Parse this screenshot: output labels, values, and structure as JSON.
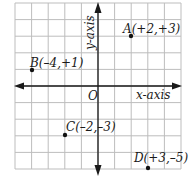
{
  "diagram": {
    "type": "coordinate-plane",
    "grid": {
      "x_min": -5,
      "x_max": 5,
      "y_min": -5,
      "y_max": 5,
      "cell_px": 16.6,
      "line_color": "#bdbdbd"
    },
    "axes": {
      "x_label": "x-axis",
      "y_label": "y-axis",
      "origin_label": "O",
      "color": "#1a1a1a"
    },
    "points": [
      {
        "name": "A",
        "label": "A(+2,+3)",
        "x": 2,
        "y": 3
      },
      {
        "name": "B",
        "label": "B(–4,+1)",
        "x": -4,
        "y": 1
      },
      {
        "name": "C",
        "label": "C(–2,–3)",
        "x": -2,
        "y": -3
      },
      {
        "name": "D",
        "label": "D(+3,–5)",
        "x": 3,
        "y": -5
      }
    ]
  }
}
